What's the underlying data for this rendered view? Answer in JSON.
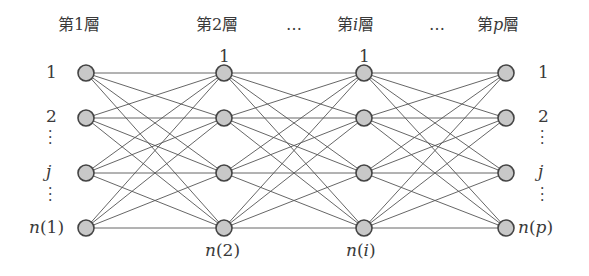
{
  "headers": [
    {
      "text": "第1層",
      "x": 58,
      "y": 15
    },
    {
      "text": "第2層",
      "x": 196,
      "y": 15
    },
    {
      "text": "…",
      "x": 285,
      "y": 15
    },
    {
      "text": "第",
      "x": 336,
      "y": 15,
      "ital": "i",
      "tail": "層"
    },
    {
      "text": "…",
      "x": 430,
      "y": 15
    },
    {
      "text": "第",
      "x": 478,
      "y": 15,
      "ital": "p",
      "tail": "層"
    }
  ],
  "layers": [
    {
      "name": "layer-1",
      "x": 86
    },
    {
      "name": "layer-2",
      "x": 224
    },
    {
      "name": "layer-i",
      "x": 364
    },
    {
      "name": "layer-p",
      "x": 506
    }
  ],
  "rows_y": [
    73,
    118,
    173,
    228
  ],
  "node_radius": 8,
  "colors": {
    "node_fill": "#c8c8c8",
    "node_stroke": "#444444",
    "edge": "#555555"
  },
  "left_labels": [
    "1",
    "2",
    "j",
    "n(1)"
  ],
  "right_labels": [
    "1",
    "2",
    "j",
    "n(p)"
  ],
  "top_labels": {
    "layer2": "1",
    "layeri": "1"
  },
  "bottom_labels": {
    "layer2": "n(2)",
    "layeri": "n(i)"
  }
}
